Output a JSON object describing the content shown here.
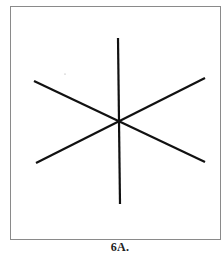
{
  "figure": {
    "caption": "6A.",
    "frame": {
      "left": 10,
      "top": 6,
      "right": 221,
      "bottom": 240,
      "stroke": "#8a8a8a"
    },
    "center": {
      "x": 119,
      "y": 121
    },
    "lines": [
      {
        "name": "vertical-line",
        "x1": 118,
        "y1": 38,
        "x2": 120,
        "y2": 204
      },
      {
        "name": "diagonal-down-line",
        "x1": 34,
        "y1": 81,
        "x2": 205,
        "y2": 162
      },
      {
        "name": "diagonal-up-line",
        "x1": 36,
        "y1": 163,
        "x2": 205,
        "y2": 78
      }
    ],
    "line_color": "#111111",
    "line_width": 2.2,
    "stray_dot": {
      "x": 65,
      "y": 74
    }
  }
}
